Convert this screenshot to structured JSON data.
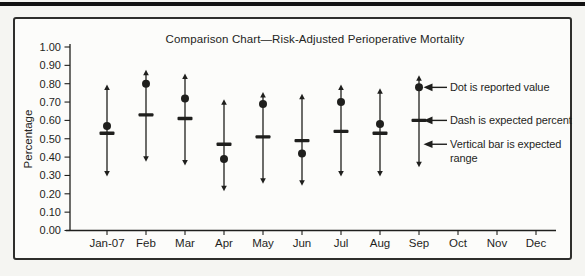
{
  "colors": {
    "ink": "#1f1f1d",
    "paper": "#f5f5f2"
  },
  "chart_data": {
    "type": "scatter",
    "title": "Comparison Chart—Risk-Adjusted Perioperative Mortality",
    "xlabel": "",
    "ylabel": "Percentage",
    "ylim": [
      0,
      1
    ],
    "ytick_step": 0.1,
    "ytick_labels": [
      "0.00",
      "0.10",
      "0.20",
      "0.30",
      "0.40",
      "0.50",
      "0.60",
      "0.70",
      "0.80",
      "0.90",
      "1.00"
    ],
    "grid": false,
    "categories": [
      "Jan-07",
      "Feb",
      "Mar",
      "Apr",
      "May",
      "Jun",
      "Jul",
      "Aug",
      "Sep",
      "Oct",
      "Nov",
      "Dec"
    ],
    "series": [
      {
        "name": "Reported value",
        "marker": "dot",
        "values": [
          0.57,
          0.8,
          0.72,
          0.39,
          0.69,
          0.42,
          0.7,
          0.58,
          0.78,
          null,
          null,
          null
        ]
      },
      {
        "name": "Expected percent",
        "marker": "dash",
        "values": [
          0.53,
          0.63,
          0.61,
          0.47,
          0.51,
          0.49,
          0.54,
          0.53,
          0.6,
          null,
          null,
          null
        ]
      },
      {
        "name": "Expected range low",
        "marker": "range-low",
        "values": [
          0.3,
          0.38,
          0.36,
          0.22,
          0.26,
          0.25,
          0.3,
          0.3,
          0.35,
          null,
          null,
          null
        ]
      },
      {
        "name": "Expected range high",
        "marker": "range-high",
        "values": [
          0.79,
          0.87,
          0.85,
          0.71,
          0.75,
          0.74,
          0.79,
          0.77,
          0.84,
          null,
          null,
          null
        ]
      }
    ],
    "annotations": [
      {
        "text": "Dot is reported value",
        "lines": [
          "Dot is reported value"
        ],
        "target_value": 0.78
      },
      {
        "text": "Dash is expected percent",
        "lines": [
          "Dash is expected percent"
        ],
        "target_value": 0.6
      },
      {
        "text": "Vertical bar is expected range",
        "lines": [
          "Vertical bar is expected",
          "range"
        ],
        "target_value": 0.47
      }
    ],
    "legend_position": "right-annotations"
  }
}
